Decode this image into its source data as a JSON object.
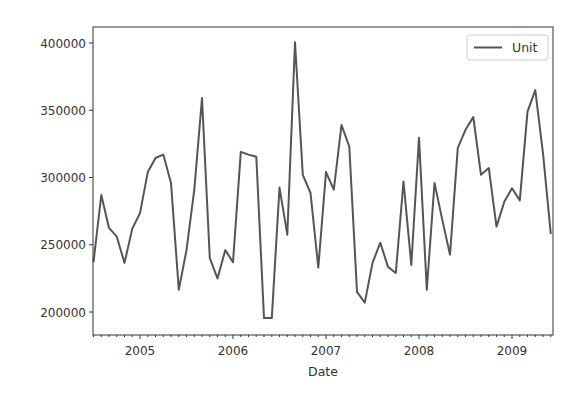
{
  "chart_data": {
    "type": "line",
    "title": "",
    "xlabel": "Date",
    "ylabel": "",
    "legend": {
      "position": "upper right",
      "entries": [
        "Unit"
      ]
    },
    "grid": false,
    "xlim": [
      "2004-07",
      "2009-06"
    ],
    "ylim": [
      185000,
      412000
    ],
    "x_ticks": [
      "2005",
      "2006",
      "2007",
      "2008",
      "2009"
    ],
    "y_ticks": [
      "200000",
      "250000",
      "300000",
      "350000",
      "400000"
    ],
    "line_color": "#555555",
    "x": [
      "2004-07",
      "2004-08",
      "2004-09",
      "2004-10",
      "2004-11",
      "2004-12",
      "2005-01",
      "2005-02",
      "2005-03",
      "2005-04",
      "2005-05",
      "2005-06",
      "2005-07",
      "2005-08",
      "2005-09",
      "2005-10",
      "2005-11",
      "2005-12",
      "2006-01",
      "2006-02",
      "2006-03",
      "2006-04",
      "2006-05",
      "2006-06",
      "2006-07",
      "2006-08",
      "2006-09",
      "2006-10",
      "2006-11",
      "2006-12",
      "2007-01",
      "2007-02",
      "2007-03",
      "2007-04",
      "2007-05",
      "2007-06",
      "2007-07",
      "2007-08",
      "2007-09",
      "2007-10",
      "2007-11",
      "2007-12",
      "2008-01",
      "2008-02",
      "2008-03",
      "2008-04",
      "2008-05",
      "2008-06",
      "2008-07",
      "2008-08",
      "2008-09",
      "2008-10",
      "2008-11",
      "2008-12",
      "2009-01",
      "2009-02",
      "2009-03",
      "2009-04",
      "2009-05",
      "2009-06"
    ],
    "series": [
      {
        "name": "Unit",
        "values": [
          237000,
          287000,
          262500,
          256000,
          236500,
          262000,
          273500,
          304000,
          314500,
          317000,
          296000,
          216500,
          246000,
          291000,
          359000,
          240000,
          225000,
          246000,
          237000,
          319000,
          317000,
          315500,
          195500,
          195500,
          292500,
          257500,
          400500,
          302000,
          288500,
          233000,
          304000,
          291000,
          339000,
          323000,
          215000,
          207000,
          236500,
          251500,
          233500,
          229000,
          297000,
          235000,
          329500,
          216500,
          296000,
          268500,
          242500,
          322000,
          335500,
          345000,
          302000,
          307000,
          263500,
          282000,
          292000,
          283000,
          349000,
          365000,
          318000,
          258000
        ]
      }
    ]
  }
}
